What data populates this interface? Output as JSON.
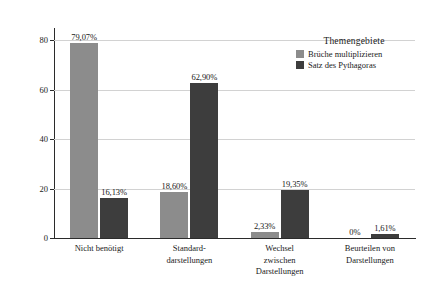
{
  "chart_data": {
    "type": "bar",
    "title": "",
    "xlabel": "",
    "ylabel": "Anteil in Prozent",
    "ylim": [
      0,
      85
    ],
    "yticks": [
      0,
      20,
      40,
      60,
      80
    ],
    "ytick_labels": [
      "0",
      "20",
      "40",
      "60",
      "80"
    ],
    "grid": true,
    "legend_position": "top-right",
    "legend_title": "Themengebiete",
    "categories": [
      "Nicht benötigt",
      "Standard-\ndarstellungen",
      "Wechsel\nzwischen\nDarstellungen",
      "Beurteilen von\nDarstellungen"
    ],
    "series": [
      {
        "name": "Brüche multiplizieren",
        "color": "#8c8c8c",
        "values": [
          79.07,
          18.6,
          2.33,
          0
        ],
        "labels": [
          "79,07%",
          "18,60%",
          "2,33%",
          "0%"
        ]
      },
      {
        "name": "Satz des Pythagoras",
        "color": "#3d3d3d",
        "values": [
          16.13,
          62.9,
          19.35,
          1.61
        ],
        "labels": [
          "16,13%",
          "62,90%",
          "19,35%",
          "1,61%"
        ]
      }
    ]
  }
}
